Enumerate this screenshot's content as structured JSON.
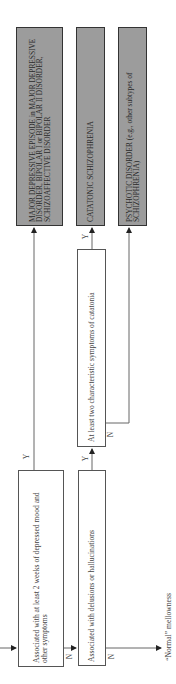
{
  "diagram": {
    "orientation": "rotated -90deg (reads bottom-to-top)",
    "questions": [
      {
        "id": "q1",
        "text": "Associated with at least 2 weeks of depressed mood and other symptoms"
      },
      {
        "id": "q2",
        "text": "Associated with delusions or hallucinations"
      },
      {
        "id": "q3",
        "text": "At least two characteristic symptoms of catatonia"
      }
    ],
    "outcomes": [
      {
        "id": "o1",
        "text": "MAJOR DEPRESSIVE EPISODE in MAJOR DEPRESSIVE DISORDER, BIPOLAR I or BIPOLAR II DISORDER, SCHIZOAFFECTIVE DISORDER"
      },
      {
        "id": "o2",
        "text": "CATATONIC SCHIZOPHRENIA"
      },
      {
        "id": "o3",
        "text": "PSYCHOTIC DISORDER (e.g., other subtypes of SCHIZOPHRENIA)"
      }
    ],
    "terminal": {
      "text": "“Normal” mellowness"
    },
    "labels": {
      "yes": "Y",
      "no": "N"
    },
    "edges": [
      {
        "from": "entry",
        "to": "q1",
        "label": ""
      },
      {
        "from": "q1",
        "to": "o1",
        "label": "Y"
      },
      {
        "from": "q1",
        "to": "q2",
        "label": "N"
      },
      {
        "from": "q2",
        "to": "q3",
        "label": "Y"
      },
      {
        "from": "q2",
        "to": "terminal",
        "label": "N"
      },
      {
        "from": "q3",
        "to": "o2",
        "label": "Y"
      },
      {
        "from": "q3",
        "to": "o3",
        "label": "N"
      }
    ],
    "colors": {
      "outcome_fill": "#9c9c9c",
      "outcome_border": "#333333",
      "line": "#555555",
      "question_fill": "#ffffff"
    }
  }
}
